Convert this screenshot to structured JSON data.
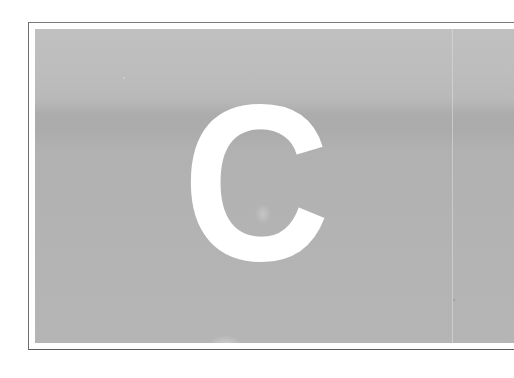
{
  "page": {
    "type": "scanned-chapter-opener",
    "initial_letter": "C",
    "panel_color": "#b5b5b5",
    "letter_color": "#ffffff",
    "frame_color": "#6e6e6e"
  }
}
